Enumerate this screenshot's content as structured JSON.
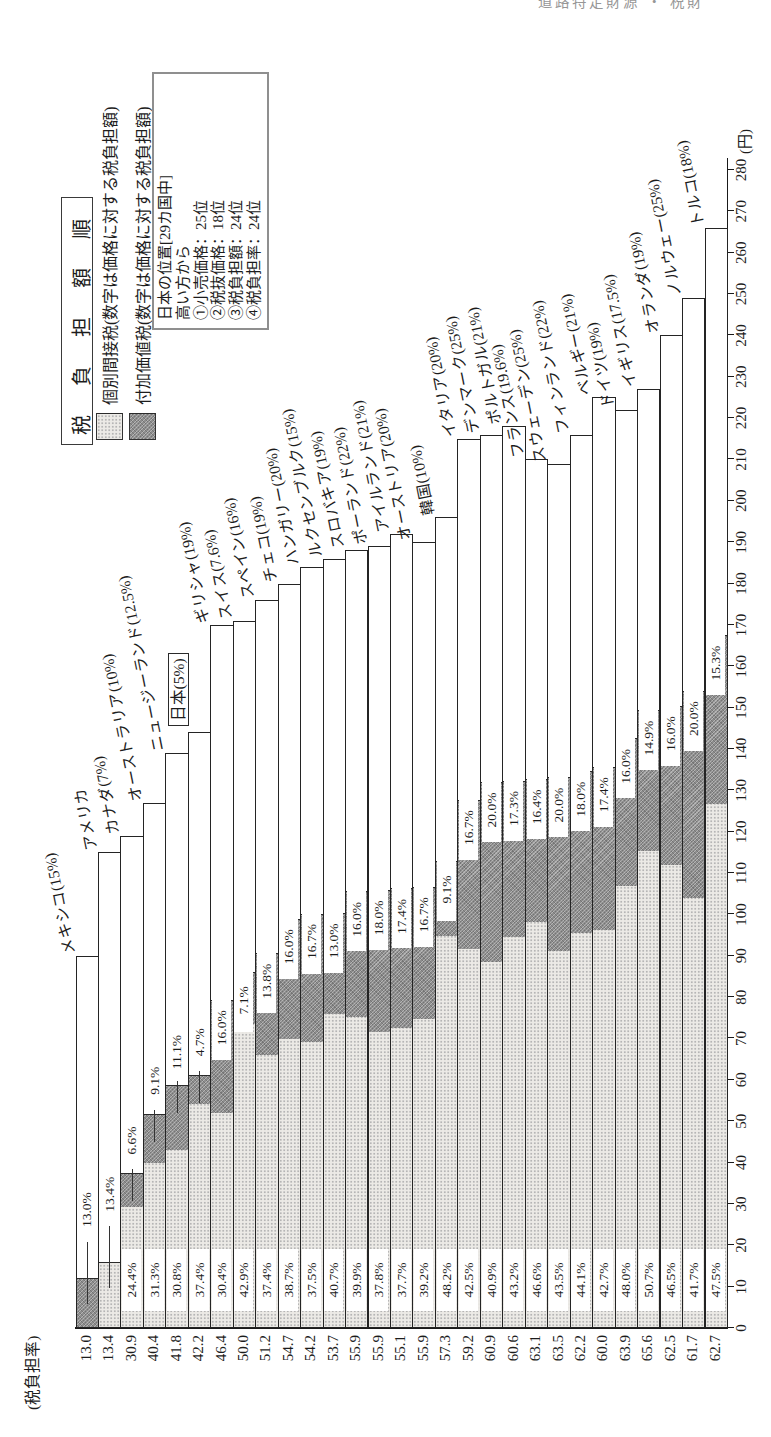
{
  "page_header_fragment": "道路特定財源 ・ 税財",
  "chart_data": {
    "type": "bar",
    "orientation": "horizontal bars, whole figure printed rotated 90° on portrait page",
    "title_display": "税 負 担 額 順",
    "rate_column_header": "(税負担率)",
    "value_axis": {
      "unit": "(円)",
      "min": 0,
      "max": 280,
      "tick_step": 10
    },
    "grid": "off",
    "legend_position": "top-right",
    "legend": [
      {
        "swatch": "light",
        "label": "個別間接税(数字は価格に対する税負担額)"
      },
      {
        "swatch": "dark",
        "label": "付加価値税(数字は価格に対する税負担額)"
      }
    ],
    "info_box": {
      "lines": [
        "日本の位置[29カ国中]",
        "高い方から",
        "①小売価格：25位",
        "②税抜価格：18位",
        "③税負担額：24位",
        "④税負担率：24位"
      ]
    },
    "colors": {
      "indirect_tax_fill": "#eceae6",
      "vat_fill": "#8e8e8e",
      "bar_outline": "#242424",
      "background": "#ffffff"
    },
    "series_note": "each bar = retail price (yen); stacked: individual indirect tax (light) + VAT (dark) + untaxed remainder (white); bottom-left column = total tax burden rate (%)",
    "countries": [
      {
        "name": "メキシコ(15%)",
        "indirect_pct": null,
        "vat_pct": "13.0%",
        "total_rate": "13.0",
        "price_yen": 90,
        "vat_label_style": "leader-far",
        "indirect_label_style": "none"
      },
      {
        "name": "アメリカ",
        "indirect_pct": "13.4%",
        "vat_pct": null,
        "total_rate": "13.4",
        "price_yen": 115,
        "vat_label_style": "none",
        "indirect_label_style": "leader-far"
      },
      {
        "name": "カナダ(7%)",
        "indirect_pct": "24.4%",
        "vat_pct": "6.6%",
        "total_rate": "30.9",
        "price_yen": 119,
        "vat_label_style": "leader",
        "indirect_label_style": "band"
      },
      {
        "name": "オーストラリア(10%)",
        "indirect_pct": "31.3%",
        "vat_pct": "9.1%",
        "total_rate": "40.4",
        "price_yen": 127,
        "vat_label_style": "leader",
        "indirect_label_style": "band"
      },
      {
        "name": "ニュージーランド(12.5%)",
        "indirect_pct": "30.8%",
        "vat_pct": "11.1%",
        "total_rate": "41.8",
        "price_yen": 139,
        "vat_label_style": "leader",
        "indirect_label_style": "band"
      },
      {
        "name": "日本(5%)",
        "indirect_pct": "37.4%",
        "vat_pct": "4.7%",
        "total_rate": "42.2",
        "price_yen": 144,
        "vat_label_style": "leader",
        "indirect_label_style": "band",
        "boxed_label": true
      },
      {
        "name": "ギリシャ(19%)",
        "indirect_pct": "30.4%",
        "vat_pct": "16.0%",
        "total_rate": "46.4",
        "price_yen": 170,
        "vat_label_style": "on",
        "indirect_label_style": "band"
      },
      {
        "name": "スイス(7.6%)",
        "indirect_pct": "42.9%",
        "vat_pct": "7.1%",
        "total_rate": "50.0",
        "price_yen": 171,
        "vat_label_style": "on",
        "indirect_label_style": "band"
      },
      {
        "name": "スペイン(16%)",
        "indirect_pct": "37.4%",
        "vat_pct": "13.8%",
        "total_rate": "51.2",
        "price_yen": 176,
        "vat_label_style": "on",
        "indirect_label_style": "band"
      },
      {
        "name": "チェコ(19%)",
        "indirect_pct": "38.7%",
        "vat_pct": "16.0%",
        "total_rate": "54.7",
        "price_yen": 180,
        "vat_label_style": "on",
        "indirect_label_style": "band"
      },
      {
        "name": "ハンガリー(20%)",
        "indirect_pct": "37.5%",
        "vat_pct": "16.7%",
        "total_rate": "54.2",
        "price_yen": 184,
        "vat_label_style": "on",
        "indirect_label_style": "band"
      },
      {
        "name": "ルクセンブルク(15%)",
        "indirect_pct": "40.7%",
        "vat_pct": "13.0%",
        "total_rate": "53.7",
        "price_yen": 186,
        "vat_label_style": "on",
        "indirect_label_style": "band"
      },
      {
        "name": "スロバキア(19%)",
        "indirect_pct": "39.9%",
        "vat_pct": "16.0%",
        "total_rate": "55.9",
        "price_yen": 188,
        "vat_label_style": "on",
        "indirect_label_style": "band"
      },
      {
        "name": "ポーランド(22%)",
        "indirect_pct": "37.8%",
        "vat_pct": "18.0%",
        "total_rate": "55.9",
        "price_yen": 189,
        "vat_label_style": "on",
        "indirect_label_style": "band"
      },
      {
        "name": "アイルランド(21%)",
        "indirect_pct": "37.7%",
        "vat_pct": "17.4%",
        "total_rate": "55.1",
        "price_yen": 192,
        "vat_label_style": "on",
        "indirect_label_style": "band"
      },
      {
        "name": "オーストリア(20%)",
        "indirect_pct": "39.2%",
        "vat_pct": "16.7%",
        "total_rate": "55.9",
        "price_yen": 190,
        "vat_label_style": "on",
        "indirect_label_style": "band"
      },
      {
        "name": "韓国(10%)",
        "indirect_pct": "48.2%",
        "vat_pct": "9.1%",
        "total_rate": "57.3",
        "price_yen": 196,
        "vat_label_style": "on",
        "indirect_label_style": "band"
      },
      {
        "name": "イタリア(20%)",
        "indirect_pct": "42.5%",
        "vat_pct": "16.7%",
        "total_rate": "59.2",
        "price_yen": 215,
        "vat_label_style": "on",
        "indirect_label_style": "band"
      },
      {
        "name": "デンマーク(25%)",
        "indirect_pct": "40.9%",
        "vat_pct": "20.0%",
        "total_rate": "60.9",
        "price_yen": 216,
        "vat_label_style": "on",
        "indirect_label_style": "band"
      },
      {
        "name": "ポルトガル(21%)",
        "indirect_pct": "43.2%",
        "vat_pct": "17.3%",
        "total_rate": "60.6",
        "price_yen": 218,
        "vat_label_style": "on",
        "indirect_label_style": "band"
      },
      {
        "name": "フランス(19.6%)",
        "indirect_pct": "46.6%",
        "vat_pct": "16.4%",
        "total_rate": "63.1",
        "price_yen": 210,
        "vat_label_style": "on",
        "indirect_label_style": "band"
      },
      {
        "name": "スウェーデン(25%)",
        "indirect_pct": "43.5%",
        "vat_pct": "20.0%",
        "total_rate": "63.5",
        "price_yen": 209,
        "vat_label_style": "on",
        "indirect_label_style": "band"
      },
      {
        "name": "フィンランド(22%)",
        "indirect_pct": "44.1%",
        "vat_pct": "18.0%",
        "total_rate": "62.2",
        "price_yen": 216,
        "vat_label_style": "on",
        "indirect_label_style": "band"
      },
      {
        "name": "ベルギー(21%)",
        "indirect_pct": "42.7%",
        "vat_pct": "17.4%",
        "total_rate": "60.0",
        "price_yen": 225,
        "vat_label_style": "on",
        "indirect_label_style": "band"
      },
      {
        "name": "ドイツ(19%)",
        "indirect_pct": "48.0%",
        "vat_pct": "16.0%",
        "total_rate": "63.9",
        "price_yen": 222,
        "vat_label_style": "on",
        "indirect_label_style": "band"
      },
      {
        "name": "イギリス(17.5%)",
        "indirect_pct": "50.7%",
        "vat_pct": "14.9%",
        "total_rate": "65.6",
        "price_yen": 227,
        "vat_label_style": "on",
        "indirect_label_style": "band"
      },
      {
        "name": "オランダ(19%)",
        "indirect_pct": "46.5%",
        "vat_pct": "16.0%",
        "total_rate": "62.5",
        "price_yen": 240,
        "vat_label_style": "on",
        "indirect_label_style": "band"
      },
      {
        "name": "ノルウェー(25%)",
        "indirect_pct": "41.7%",
        "vat_pct": "20.0%",
        "total_rate": "61.7",
        "price_yen": 249,
        "vat_label_style": "on",
        "indirect_label_style": "band"
      },
      {
        "name": "トルコ(18%)",
        "indirect_pct": "47.5%",
        "vat_pct": "15.3%",
        "total_rate": "62.7",
        "price_yen": 266,
        "vat_label_style": "on",
        "indirect_label_style": "band"
      }
    ]
  }
}
